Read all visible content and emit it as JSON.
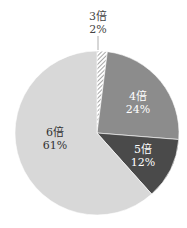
{
  "chart_data": {
    "type": "pie",
    "title": "",
    "start_angle_deg": 0,
    "direction": "clockwise",
    "slices": [
      {
        "label": "3倍",
        "percent_label": "2%",
        "value": 2,
        "color": "#ffffff",
        "pattern": "diagonal-hatch",
        "text_color": "#444444"
      },
      {
        "label": "4倍",
        "percent_label": "24%",
        "value": 24,
        "color": "#8c8c8c",
        "pattern": "solid",
        "text_color": "#ffffff"
      },
      {
        "label": "5倍",
        "percent_label": "12%",
        "value": 12,
        "color": "#4a4a4a",
        "pattern": "solid",
        "text_color": "#ffffff"
      },
      {
        "label": "6倍",
        "percent_label": "61%",
        "value": 61,
        "color": "#d8d8d8",
        "pattern": "solid",
        "text_color": "#333333"
      }
    ],
    "legend": "none",
    "labels_position": "inside (3倍 outside with leader line)"
  }
}
